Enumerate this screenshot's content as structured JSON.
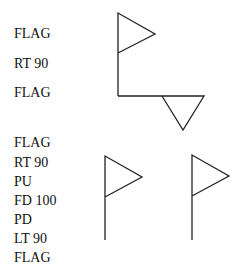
{
  "top_program": [
    "FLAG",
    "RT 90",
    "FLAG"
  ],
  "bottom_program": [
    "FLAG",
    "RT 90",
    "PU",
    "FD 100",
    "PD",
    "LT 90",
    "FLAG"
  ]
}
